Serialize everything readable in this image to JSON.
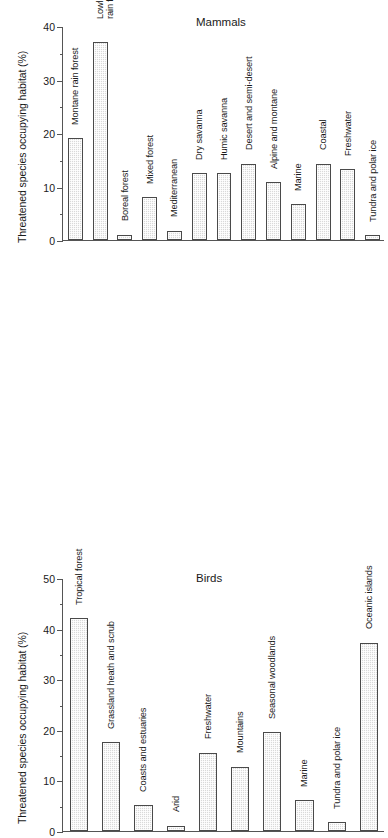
{
  "chart_data": [
    {
      "type": "bar",
      "title": "Mammals",
      "xlabel": "",
      "ylabel": "Threatened species occupying habitat (%)",
      "ylim": [
        0,
        40
      ],
      "yticks": [
        0,
        10,
        20,
        30,
        40
      ],
      "ytick_labels": [
        "0",
        "10",
        "20",
        "30",
        "40"
      ],
      "minor_tick_interval": 5,
      "grid": false,
      "legend": "none",
      "categories": [
        "Montane rain forest",
        "Lowland\nrain forest",
        "Boreal forest",
        "Mixed forest",
        "Mediterranean",
        "Dry savanna",
        "Humic savanna",
        "Desert and semi-desert",
        "Alpine and montane",
        "Marine",
        "Coastal",
        "Freshwater",
        "Tundra and polar ice"
      ],
      "values": [
        19,
        37,
        1,
        8,
        1.7,
        12.5,
        12.5,
        14.2,
        10.8,
        6.7,
        14.2,
        13.2,
        0.9
      ]
    },
    {
      "type": "bar",
      "title": "Birds",
      "xlabel": "",
      "ylabel": "Threatened species occupying habitat (%)",
      "ylim": [
        0,
        50
      ],
      "yticks": [
        0,
        10,
        20,
        30,
        40,
        50
      ],
      "ytick_labels": [
        "0",
        "10",
        "20",
        "30",
        "40",
        "50"
      ],
      "minor_tick_interval": 5,
      "grid": false,
      "legend": "none",
      "categories": [
        "Tropical forest",
        "Grassland heath and scrub",
        "Coasts and estuaries",
        "Arid",
        "Freshwater",
        "Mountains",
        "Seasonal woodlands",
        "Marine",
        "Tundra and polar ice",
        "Oceanic islands"
      ],
      "values": [
        42,
        17.5,
        5.1,
        1.0,
        15.5,
        12.7,
        19.5,
        6.1,
        1.7,
        37.2
      ]
    }
  ],
  "style": {
    "bar_fill": "#d9d9d9",
    "bar_stroke": "#4a4a4a",
    "axis_color": "#555555",
    "text_color": "#1a1a1a",
    "background": "#ffffff"
  }
}
